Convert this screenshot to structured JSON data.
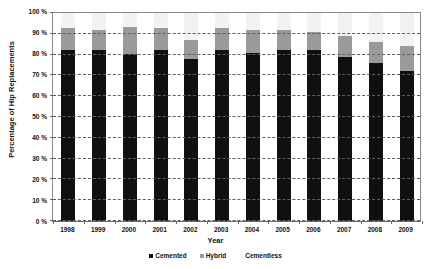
{
  "chart_data": {
    "type": "bar",
    "subtype": "stacked-percentage-column",
    "title": "",
    "xlabel": "Year",
    "ylabel": "Percentage of Hip Replacements",
    "categories": [
      "1998",
      "1999",
      "2000",
      "2001",
      "2002",
      "2003",
      "2004",
      "2005",
      "2006",
      "2007",
      "2008",
      "2009"
    ],
    "series": [
      {
        "name": "Cemented",
        "color": "#101010",
        "values": [
          82,
          82,
          80.5,
          82,
          78,
          82,
          81,
          82,
          82,
          79,
          76,
          72
        ]
      },
      {
        "name": "Hybrid",
        "color": "#9a9a9a",
        "values": [
          11,
          10,
          13,
          11,
          9,
          11,
          11,
          10,
          9,
          10,
          10,
          12
        ]
      },
      {
        "name": "Cementless",
        "color": "#f2f2f2",
        "values": [
          7,
          8,
          6.5,
          7,
          13,
          7,
          8,
          8,
          9,
          11,
          14,
          16
        ]
      }
    ],
    "stack_tops_cemented": [
      82,
      82,
      80.5,
      82,
      78,
      82,
      81,
      82,
      82,
      79,
      76,
      72
    ],
    "stack_tops_hybrid": [
      93,
      92,
      93.5,
      93,
      87,
      93,
      92,
      92,
      91,
      89,
      86,
      84
    ],
    "ylim": [
      0,
      100
    ],
    "ytick_step": 10,
    "ytick_labels": [
      "0 %",
      "10 %",
      "20 %",
      "30 %",
      "40 %",
      "50 %",
      "60 %",
      "70 %",
      "80 %",
      "90 %",
      "100 %"
    ],
    "ytick_values": [
      0,
      10,
      20,
      30,
      40,
      50,
      60,
      70,
      80,
      90,
      100
    ],
    "grid": true,
    "grid_style": "dashed",
    "legend_position": "bottom",
    "legend": [
      "Cemented",
      "Hybrid",
      "Cementless"
    ]
  }
}
